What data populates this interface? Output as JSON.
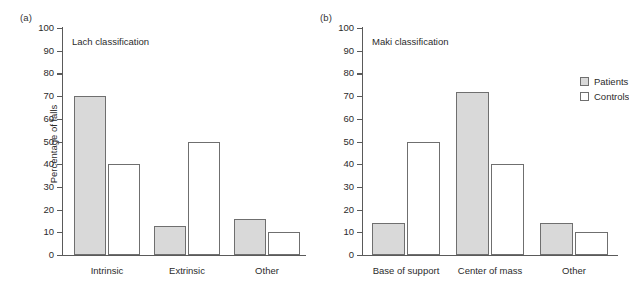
{
  "figure": {
    "background": "#ffffff",
    "series_colors": {
      "patients": "#d9d9d9",
      "controls": "#ffffff",
      "outline": "#6f6f6f",
      "axis": "#5a5a5a"
    }
  },
  "panels": [
    {
      "tag": "(a)",
      "title": "Lach classification",
      "ylabel": "Percentage of falls"
    },
    {
      "tag": "(b)",
      "title": "Maki classification",
      "ylabel": ""
    }
  ],
  "legend": {
    "position": "top-right-of-panel-b",
    "entries": [
      {
        "label": "Patients",
        "swatch": "filled-gray-square-icon"
      },
      {
        "label": "Controls",
        "swatch": "empty-white-square-icon"
      }
    ]
  },
  "yticks": [
    "0",
    "10",
    "20",
    "30",
    "40",
    "50",
    "60",
    "70",
    "80",
    "90",
    "100"
  ],
  "chart_data": [
    {
      "type": "bar",
      "title": "Lach classification",
      "panel": "(a)",
      "categories": [
        "Intrinsic",
        "Extrinsic",
        "Other"
      ],
      "series": [
        {
          "name": "Patients",
          "values": [
            70,
            13,
            16
          ]
        },
        {
          "name": "Controls",
          "values": [
            40,
            50,
            10
          ]
        }
      ],
      "xlabel": "",
      "ylabel": "Percentage of falls",
      "ylim": [
        0,
        100
      ],
      "ytick_step": 10,
      "grid": false,
      "legend_position": "none"
    },
    {
      "type": "bar",
      "title": "Maki classification",
      "panel": "(b)",
      "categories": [
        "Base of support",
        "Center of mass",
        "Other"
      ],
      "series": [
        {
          "name": "Patients",
          "values": [
            14,
            72,
            14
          ]
        },
        {
          "name": "Controls",
          "values": [
            50,
            40,
            10
          ]
        }
      ],
      "xlabel": "",
      "ylabel": "",
      "ylim": [
        0,
        100
      ],
      "ytick_step": 10,
      "grid": false,
      "legend_position": "upper right"
    }
  ]
}
